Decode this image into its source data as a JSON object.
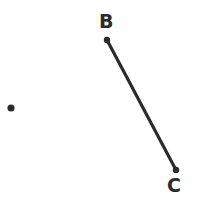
{
  "figure": {
    "title": "",
    "background_color": "#ffffff",
    "stroke_color": "#2b2b2b",
    "width": 200,
    "height": 206
  },
  "labels": {
    "b": "B",
    "c": "C"
  },
  "chart_data": {
    "type": "scatter",
    "title": "",
    "xlabel": "",
    "ylabel": "",
    "xlim": [
      0,
      200
    ],
    "ylim": [
      0,
      206
    ],
    "grid": false,
    "legend": null,
    "points": [
      {
        "label": "B",
        "x": 107,
        "y": 40,
        "radius": 3.2,
        "color": "#2b2b2b"
      },
      {
        "label": "C",
        "x": 176,
        "y": 170,
        "radius": 3.2,
        "color": "#2b2b2b"
      },
      {
        "label": "",
        "x": 11,
        "y": 108,
        "radius": 3.6,
        "color": "#2b2b2b"
      }
    ],
    "segments": [
      {
        "name": "BC",
        "from": "B",
        "to": "C",
        "x1": 107,
        "y1": 40,
        "x2": 176,
        "y2": 170,
        "width": 3.2,
        "color": "#2b2b2b"
      }
    ],
    "label_positions": [
      {
        "text": "B",
        "x": 99,
        "y": 12
      },
      {
        "text": "C",
        "x": 167,
        "y": 176
      }
    ]
  }
}
